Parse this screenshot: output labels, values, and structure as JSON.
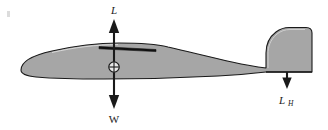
{
  "figure": {
    "background_color": "#ffffff",
    "body_fill_color": "#a6a6a6",
    "body_stroke_color": "#1a1a1a",
    "arrow_color": "#1a1a1a",
    "wing_root_color": "#111111"
  },
  "aircraft": {
    "name": "glider-silhouette",
    "parts": [
      {
        "name": "fuselage",
        "label": "fuselage"
      },
      {
        "name": "wing-root",
        "label": "wing root"
      },
      {
        "name": "tail-boom",
        "label": "tail boom"
      },
      {
        "name": "vertical-stabilizer",
        "label": "vertical stabilizer"
      },
      {
        "name": "horizontal-stabilizer",
        "label": "horizontal stabilizer"
      }
    ]
  },
  "cg_marker": {
    "name": "center-of-gravity-marker",
    "symbol": "circle-with-cross",
    "x": 114,
    "y": 67
  },
  "vectors": [
    {
      "id": "lift",
      "name": "lift-vector",
      "label": "L",
      "subscript": "",
      "direction": "up",
      "label_x": 114,
      "label_y": 13,
      "tail_x": 114,
      "tail_y": 67,
      "head_x": 114,
      "head_y": 20
    },
    {
      "id": "weight",
      "name": "weight-vector",
      "label": "W",
      "subscript": "",
      "direction": "down",
      "label_x": 114,
      "label_y": 122,
      "tail_x": 114,
      "tail_y": 67,
      "head_x": 114,
      "head_y": 108
    },
    {
      "id": "tail-load",
      "name": "horizontal-tail-load-vector",
      "label": "L",
      "subscript": "H",
      "direction": "down",
      "label_x": 287,
      "label_y": 103,
      "tail_x": 287,
      "tail_y": 74,
      "head_x": 287,
      "head_y": 88
    }
  ]
}
